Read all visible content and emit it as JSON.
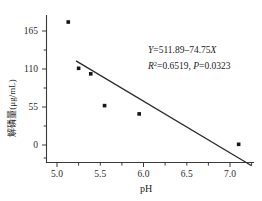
{
  "chart_data": {
    "type": "scatter",
    "title": "",
    "subtitle": "",
    "xlabel": "pH",
    "ylabel": "解磷量(μg/mL)",
    "xlim": [
      4.8,
      7.3
    ],
    "ylim": [
      -28,
      190
    ],
    "grid": false,
    "legend": null,
    "xticks": [
      "5.0",
      "5.5",
      "6.0",
      "6.5",
      "7.0"
    ],
    "xtick_values": [
      5.0,
      5.5,
      6.0,
      6.5,
      7.0
    ],
    "yticks": [
      "165",
      "110",
      "55",
      "0"
    ],
    "ytick_values": [
      165,
      110,
      55,
      0
    ],
    "points": [
      {
        "x": 5.13,
        "y": 178
      },
      {
        "x": 5.25,
        "y": 111
      },
      {
        "x": 5.39,
        "y": 103
      },
      {
        "x": 5.55,
        "y": 57
      },
      {
        "x": 5.95,
        "y": 45
      },
      {
        "x": 7.1,
        "y": 1
      }
    ],
    "series": [
      {
        "name": "解磷量",
        "x": [
          5.13,
          5.25,
          5.39,
          5.55,
          5.95,
          7.1
        ],
        "values": [
          178,
          111,
          103,
          57,
          45,
          1
        ]
      }
    ],
    "fit_line": {
      "type": "linear",
      "slope": -74.75,
      "intercept": 511.89,
      "x_start": 5.22,
      "x_end": 7.25
    },
    "annotations": {
      "equation_y": "Y",
      "equation_body": "=511.89–74.75",
      "equation_x": "X",
      "equation_full": "Y=511.89–74.75X",
      "stats_r": "R",
      "stats_r_sup": "2",
      "stats_r_val": "=0.6519, ",
      "stats_p": "P",
      "stats_p_val": "=0.0323",
      "stats_full": "R2=0.6519, P=0.0323"
    }
  },
  "colors": {
    "axis": "#3a3a3a",
    "point": "#151515",
    "fit_line": "#2b2b2b",
    "text": "#1c1c1c",
    "background": "#ffffff"
  }
}
